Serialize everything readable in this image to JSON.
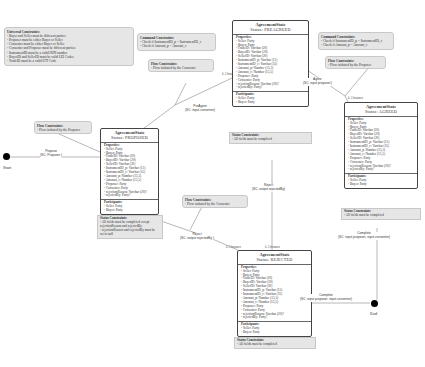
{
  "universal_constraints": {
    "title": "Universal Constraints:",
    "items": [
      "- Buyer and Seller must be different parties",
      "- Proposer must be either Buyer or Seller",
      "- Consenter must be either Buyer or Seller",
      "- Consenter and Proposer must be different parties",
      "- InstrumentID must be a valid ISIN number",
      "- BuyerID and SellerID must be valid LEI Codes",
      "- TradeID must be a valid UTI Code"
    ]
  },
  "start": {
    "label": "Start"
  },
  "end": {
    "label": "End"
  },
  "properties_list": [
    "- Seller: Party",
    "- Buyer: Party",
    "- TradeID: Varchar (20)",
    "- BuyerID: Varchar (20)",
    "- SellerID: Varchar (20)",
    "- InstrumentID_p: Varchar (15)",
    "- InstrumentID_c: Varchar (15)",
    "- Amount_p: Number (15,5)",
    "- Amount_c: Number (15,5)",
    "- Proposer: Party",
    "- Consenter: Party",
    "- rejectionReason: Varchar (20)?",
    "- rejectedBy: Party?"
  ],
  "participants_list": [
    "- Seller: Party",
    "- Buyer: Party"
  ],
  "states": {
    "proposed": {
      "name": "AgreementState",
      "status": "Status: PROPOSED",
      "properties_title": "Properties:",
      "participants_title": "Participants:",
      "status_constraints_title": "Status Constraints:",
      "status_constraints": [
        "- All fields must be completed except",
        "rejectionReason and rejectedBy",
        "- rejectionReason and rejectedBy must be",
        "set to null"
      ]
    },
    "preagreed": {
      "name": "AgreementState",
      "status": "Status: PREAGREED",
      "properties_title": "Properties:",
      "participants_title": "Participants:",
      "status_constraints_title": "Status Constraints:",
      "status_constraints": [
        "- All fields must be completed"
      ]
    },
    "agreed": {
      "name": "AgreementState",
      "status": "Status: AGREED",
      "properties_title": "Properties:",
      "participants_title": "Participants:",
      "status_constraints_title": "Status Constraints:",
      "status_constraints": [
        "- All fields must be completed"
      ]
    },
    "rejected": {
      "name": "AgreementState",
      "status": "Status: REJECTED",
      "properties_title": "Properties:",
      "participants_title": "Participants:",
      "status_constraints_title": "Status Constraints:",
      "status_constraints": [
        "- All fields must be completed"
      ]
    }
  },
  "notes": {
    "flow_proposed": {
      "title": "Flow Constraints:",
      "text": "- Flow initiated by the Proposer"
    },
    "command_preagree": {
      "title": "Command Constraints:",
      "items": [
        "- Check if InstrumentID_p = InstrumentID_c",
        "- Check if Amount_p = Amount_c"
      ]
    },
    "flow_preagree": {
      "title": "Flow Constraints:",
      "text": "- Flow initiated by the Consenter"
    },
    "command_agree": {
      "title": "Command Constraints:",
      "items": [
        "- Check if InstrumentID_p = InstrumentID_c",
        "- Check if Amount_p = Amount_c"
      ]
    },
    "flow_agree": {
      "title": "Flow Constraints:",
      "text": "- Flow initiated by the Proposer"
    },
    "flow_reject": {
      "title": "Flow Constraints:",
      "text": "- Flow initiated by the Consenter"
    }
  },
  "transitions": {
    "propose": {
      "name": "Propose",
      "sig": "(SC: Proposer )"
    },
    "preagree": {
      "name": "PreAgree",
      "sig": "(SC: input consenter)"
    },
    "agree": {
      "name": "Agree",
      "sig": "(SC: input proposer)"
    },
    "reject_left": {
      "name": "Reject",
      "sig": "(SC: output rejectedBy )"
    },
    "reject_top": {
      "name": "Reject",
      "sig": "(SC: output rejectedBy)"
    },
    "complete_agreed": {
      "name": "Complete",
      "sig": "(SC: input proposer, input consenter)"
    },
    "complete_rejected": {
      "name": "Complete",
      "sig": "(SC: input proposer, input consenter)"
    }
  },
  "multiplicity": "0..1 Instance",
  "colors": {
    "note_bg": "#e6e6e6",
    "border": "#444444",
    "line": "#888888"
  }
}
